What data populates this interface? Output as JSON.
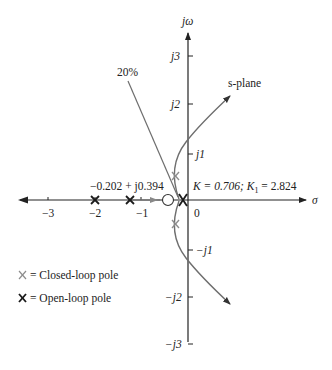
{
  "plane_label": "s-plane",
  "axes": {
    "imag_label": "jω",
    "real_label": "σ",
    "real_ticks": [
      "−3",
      "−2",
      "−1",
      "0"
    ],
    "imag_ticks": [
      "j3",
      "j2",
      "j1",
      "−j1",
      "−j2",
      "−j3"
    ]
  },
  "annotations": {
    "damping_line": "20%",
    "closed_loop_point": "−0.202 + j0.394",
    "gain": "K = 0.706; K",
    "gain_sub": "1",
    "gain_val": " = 2.824"
  },
  "legend": {
    "closed_loop": "= Closed-loop pole",
    "open_loop": "= Open-loop pole"
  },
  "colors": {
    "axis": "#222222",
    "locus": "#6e6e6e",
    "closed_pole": "#8c8c8c",
    "open_pole": "#1a1a1a"
  }
}
